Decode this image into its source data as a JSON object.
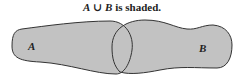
{
  "title": {
    "set_a": "A",
    "union_symbol": "∪",
    "set_b": "B",
    "suffix": "is shaded."
  },
  "diagram": {
    "type": "venn",
    "operation": "union",
    "sets": [
      {
        "label": "A",
        "shaded": true
      },
      {
        "label": "B",
        "shaded": true
      }
    ],
    "colors": {
      "fill": "#c2c2c2",
      "stroke": "#333333",
      "background": "#ffffff"
    }
  }
}
